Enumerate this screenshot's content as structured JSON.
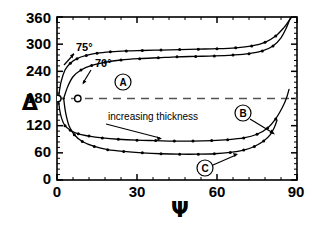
{
  "chart_data": {
    "type": "line",
    "title": "",
    "xlabel": "Ψ",
    "ylabel": "Δ",
    "xlim": [
      0,
      90
    ],
    "ylim": [
      0,
      360
    ],
    "xticks": [
      0,
      30,
      60,
      90
    ],
    "yticks": [
      0,
      60,
      120,
      180,
      240,
      300,
      360
    ],
    "xtick_labels": [
      "0",
      "30",
      "60",
      "90"
    ],
    "ytick_labels": [
      "0",
      "60",
      "120",
      "180",
      "240",
      "300",
      "360"
    ],
    "grid": false,
    "legend": "none",
    "reference_lines": [
      {
        "name": "delta-180-dashed",
        "orientation": "horizontal",
        "value": 180,
        "style": "dashed"
      }
    ],
    "annotations": [
      {
        "name": "angle-75",
        "text": "75°",
        "x": 11,
        "y": 268
      },
      {
        "name": "angle-70",
        "text": "70°",
        "x": 22,
        "y": 238
      },
      {
        "name": "label-A",
        "text": "A",
        "x": 24,
        "y": 215
      },
      {
        "name": "label-B",
        "text": "B",
        "x": 70,
        "y": 146
      },
      {
        "name": "label-C",
        "text": "C",
        "x": 55,
        "y": 25
      },
      {
        "name": "increasing-thickness",
        "text": "increasing thickness",
        "x": 24,
        "y": 150
      }
    ],
    "series": [
      {
        "name": "upper-branch-75deg",
        "comment": "top curve, 75 degree incidence",
        "points": [
          [
            0.5,
            180
          ],
          [
            1.5,
            216
          ],
          [
            3.0,
            243
          ],
          [
            5.0,
            258
          ],
          [
            7.5,
            268
          ],
          [
            11,
            275
          ],
          [
            15,
            280
          ],
          [
            20,
            283
          ],
          [
            26,
            285
          ],
          [
            32,
            286
          ],
          [
            39,
            287
          ],
          [
            46,
            288
          ],
          [
            53,
            289
          ],
          [
            60,
            290
          ],
          [
            67,
            292
          ],
          [
            73,
            296
          ],
          [
            78,
            304
          ],
          [
            82,
            318
          ],
          [
            85,
            336
          ],
          [
            87,
            352
          ],
          [
            88,
            360
          ]
        ]
      },
      {
        "name": "upper-branch-70deg",
        "comment": "second curve, 70 degree incidence",
        "points": [
          [
            2.5,
            180
          ],
          [
            4.0,
            206
          ],
          [
            6.0,
            228
          ],
          [
            9.0,
            243
          ],
          [
            13,
            253
          ],
          [
            18,
            260
          ],
          [
            24,
            265
          ],
          [
            31,
            268
          ],
          [
            38,
            270
          ],
          [
            45,
            272
          ],
          [
            52,
            273
          ],
          [
            59,
            274
          ],
          [
            66,
            276
          ],
          [
            72,
            279
          ],
          [
            77,
            285
          ],
          [
            81,
            296
          ],
          [
            84,
            314
          ],
          [
            86,
            336
          ],
          [
            87.5,
            358
          ]
        ]
      },
      {
        "name": "lower-branch-75deg",
        "comment": "third curve, drops from 180 down to ~95 then flattens and rises at right",
        "points": [
          [
            0.5,
            180
          ],
          [
            1.0,
            155
          ],
          [
            1.8,
            135
          ],
          [
            3.0,
            120
          ],
          [
            5.0,
            110
          ],
          [
            8.0,
            102
          ],
          [
            12,
            97
          ],
          [
            17,
            93
          ],
          [
            23,
            90
          ],
          [
            30,
            88
          ],
          [
            37,
            87
          ],
          [
            44,
            86
          ],
          [
            51,
            86
          ],
          [
            58,
            87
          ],
          [
            64,
            89
          ],
          [
            70,
            93
          ],
          [
            75,
            101
          ],
          [
            79,
            115
          ],
          [
            82,
            135
          ],
          [
            84.5,
            160
          ],
          [
            86,
            180
          ],
          [
            87,
            200
          ]
        ]
      },
      {
        "name": "lower-branch-70deg",
        "comment": "fourth curve, lowest, drops to ~58 and ends near x=82",
        "points": [
          [
            2.5,
            180
          ],
          [
            3.2,
            150
          ],
          [
            4.5,
            120
          ],
          [
            6.5,
            100
          ],
          [
            9.5,
            85
          ],
          [
            14,
            74
          ],
          [
            19,
            67
          ],
          [
            25,
            63
          ],
          [
            32,
            60
          ],
          [
            39,
            58
          ],
          [
            46,
            57
          ],
          [
            53,
            57
          ],
          [
            59,
            58
          ],
          [
            65,
            61
          ],
          [
            70,
            66
          ],
          [
            74,
            74
          ],
          [
            77.5,
            86
          ],
          [
            80,
            100
          ],
          [
            81.5,
            116
          ],
          [
            82.5,
            132
          ]
        ]
      }
    ],
    "markers": [
      {
        "name": "open-circle-origin",
        "x": 0.3,
        "y": 180,
        "style": "open"
      },
      {
        "name": "open-circle-second",
        "x": 7.8,
        "y": 180,
        "style": "open"
      }
    ]
  },
  "axes": {
    "y_axis_symbol": "Δ",
    "x_axis_symbol": "Ψ"
  },
  "labels": {
    "angle_75": "75°",
    "angle_70": "70°",
    "circle_a": "A",
    "circle_b": "B",
    "circle_c": "C",
    "increasing_thickness": "increasing thickness"
  },
  "ticks": {
    "y": [
      "360",
      "300",
      "240",
      "180",
      "120",
      "60",
      "0"
    ],
    "x": [
      "0",
      "30",
      "60",
      "90"
    ]
  },
  "colors": {
    "line": "#000000",
    "background": "#ffffff",
    "dashed": "#555555"
  }
}
